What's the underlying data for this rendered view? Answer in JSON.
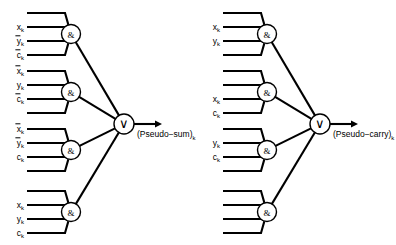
{
  "figure": {
    "type": "logic-circuit-diagram",
    "background_color": "#ffffff",
    "line_color": "#000000",
    "width": 396,
    "height": 245
  },
  "glyphs": {
    "and_gate": "&",
    "or_gate": "∨"
  },
  "left_circuit": {
    "name": "pseudo-sum-circuit",
    "output_label_text": "(Pseudo−sum)",
    "output_label_subscript": "k",
    "or_gate_name": "or-gate",
    "and_gates": [
      {
        "name": "and-gate-1",
        "inputs": [
          {
            "base": "",
            "sub": "",
            "overbar": false,
            "labeled": false
          },
          {
            "base": "x",
            "sub": "k",
            "overbar": false,
            "labeled": true
          },
          {
            "base": "y",
            "sub": "k",
            "overbar": true,
            "labeled": true
          },
          {
            "base": "c",
            "sub": "k",
            "overbar": true,
            "labeled": true
          }
        ]
      },
      {
        "name": "and-gate-2",
        "inputs": [
          {
            "base": "x",
            "sub": "k",
            "overbar": true,
            "labeled": true
          },
          {
            "base": "y",
            "sub": "k",
            "overbar": false,
            "labeled": true
          },
          {
            "base": "c",
            "sub": "k",
            "overbar": true,
            "labeled": true
          },
          {
            "base": "",
            "sub": "",
            "overbar": false,
            "labeled": false
          }
        ]
      },
      {
        "name": "and-gate-3",
        "inputs": [
          {
            "base": "x",
            "sub": "k",
            "overbar": true,
            "labeled": true
          },
          {
            "base": "y",
            "sub": "k",
            "overbar": true,
            "labeled": true
          },
          {
            "base": "c",
            "sub": "k",
            "overbar": false,
            "labeled": true
          },
          {
            "base": "",
            "sub": "",
            "overbar": false,
            "labeled": false
          }
        ]
      },
      {
        "name": "and-gate-4",
        "inputs": [
          {
            "base": "",
            "sub": "",
            "overbar": false,
            "labeled": false
          },
          {
            "base": "x",
            "sub": "k",
            "overbar": false,
            "labeled": true
          },
          {
            "base": "y",
            "sub": "k",
            "overbar": false,
            "labeled": true
          },
          {
            "base": "c",
            "sub": "k",
            "overbar": false,
            "labeled": true
          }
        ]
      }
    ]
  },
  "right_circuit": {
    "name": "pseudo-carry-circuit",
    "output_label_text": "(Pseudo−carry)",
    "output_label_subscript": "k",
    "or_gate_name": "or-gate",
    "and_gates": [
      {
        "name": "and-gate-1",
        "inputs": [
          {
            "base": "",
            "sub": "",
            "overbar": false,
            "labeled": false
          },
          {
            "base": "x",
            "sub": "k",
            "overbar": false,
            "labeled": true
          },
          {
            "base": "y",
            "sub": "k",
            "overbar": false,
            "labeled": true
          },
          {
            "base": "",
            "sub": "",
            "overbar": false,
            "labeled": false
          }
        ]
      },
      {
        "name": "and-gate-2",
        "inputs": [
          {
            "base": "",
            "sub": "",
            "overbar": false,
            "labeled": false
          },
          {
            "base": "",
            "sub": "",
            "overbar": false,
            "labeled": false
          },
          {
            "base": "x",
            "sub": "k",
            "overbar": false,
            "labeled": true
          },
          {
            "base": "c",
            "sub": "k",
            "overbar": false,
            "labeled": true
          }
        ]
      },
      {
        "name": "and-gate-3",
        "inputs": [
          {
            "base": "",
            "sub": "",
            "overbar": false,
            "labeled": false
          },
          {
            "base": "y",
            "sub": "k",
            "overbar": false,
            "labeled": true
          },
          {
            "base": "c",
            "sub": "k",
            "overbar": false,
            "labeled": true
          },
          {
            "base": "",
            "sub": "",
            "overbar": false,
            "labeled": false
          }
        ]
      },
      {
        "name": "and-gate-4",
        "inputs": [
          {
            "base": "",
            "sub": "",
            "overbar": false,
            "labeled": false
          },
          {
            "base": "",
            "sub": "",
            "overbar": false,
            "labeled": false
          },
          {
            "base": "",
            "sub": "",
            "overbar": false,
            "labeled": false
          },
          {
            "base": "",
            "sub": "",
            "overbar": false,
            "labeled": false
          }
        ]
      }
    ]
  },
  "geometry": {
    "and_radius": 9.5,
    "or_radius": 10,
    "input_line_start_dx": 0,
    "input_line_end_dx": 38,
    "row_spacing": 14,
    "group_tops": [
      13,
      71,
      129,
      191
    ],
    "left_origin_x": 27,
    "right_origin_x": 223,
    "and_gate_x_left": 71,
    "and_gate_x_right": 267,
    "or_gate_x_left": 124,
    "or_gate_x_right": 320,
    "or_gate_y": 124,
    "arrow_length": 28
  }
}
